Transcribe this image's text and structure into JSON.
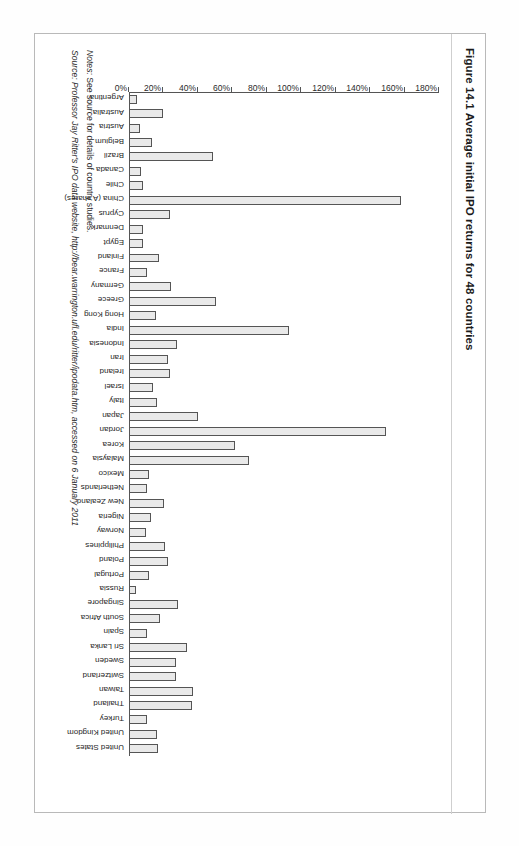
{
  "figure": {
    "number": "Figure 14.1",
    "title": "Average initial IPO returns for 48 countries",
    "full_title": "Figure 14.1  Average initial IPO returns for 48 countries"
  },
  "footer": {
    "notes_lead": "Notes:",
    "notes_text": " See source for details of country studies.",
    "source_lead": "Source:",
    "source_text": " Professor Jay Ritter's IPO data website, http://bear.warrington.ufl.edu/ritter/ipodata.htm, accessed on 6 January 2011"
  },
  "chart_data": {
    "type": "bar",
    "title": "Average initial IPO returns for 48 countries",
    "xlabel": "",
    "ylabel": "",
    "ylim": [
      0,
      180
    ],
    "ytick_step": 20,
    "ytick_labels": [
      "0%",
      "20%",
      "40%",
      "60%",
      "80%",
      "100%",
      "120%",
      "140%",
      "160%",
      "180%"
    ],
    "grid": false,
    "legend": "none",
    "orientation": "vertical-rotated",
    "unit": "%",
    "bar_fill": "#e9e9e9",
    "bar_stroke": "#555555",
    "categories": [
      "Argentina",
      "Australia",
      "Austria",
      "Belgium",
      "Brazil",
      "Canada",
      "Chile",
      "China (A shares)",
      "Cyprus",
      "Denmark",
      "Egypt",
      "Finland",
      "France",
      "Germany",
      "Greece",
      "Hong Kong",
      "India",
      "Indonesia",
      "Iran",
      "Ireland",
      "Israel",
      "Italy",
      "Japan",
      "Jordan",
      "Korea",
      "Malaysia",
      "Mexico",
      "Netherlands",
      "New Zealand",
      "Nigeria",
      "Norway",
      "Philippines",
      "Poland",
      "Portugal",
      "Russia",
      "Singapore",
      "South Africa",
      "Spain",
      "Sri Lanka",
      "Sweden",
      "Switzerland",
      "Taiwan",
      "Thailand",
      "Turkey",
      "United Kingdom",
      "United States"
    ],
    "values": [
      4.4,
      19.8,
      6.5,
      13.5,
      48.7,
      7.1,
      8.4,
      157.7,
      23.7,
      8.1,
      8.4,
      17.2,
      10.7,
      24.2,
      50.8,
      15.4,
      92.7,
      27.7,
      22.4,
      23.7,
      13.8,
      16.4,
      40.2,
      149.0,
      61.6,
      69.6,
      11.6,
      10.2,
      20.3,
      12.7,
      9.6,
      21.2,
      22.9,
      11.9,
      4.2,
      28.3,
      18.0,
      10.7,
      33.5,
      27.3,
      27.3,
      37.2,
      36.6,
      10.6,
      16.3,
      16.9
    ]
  }
}
